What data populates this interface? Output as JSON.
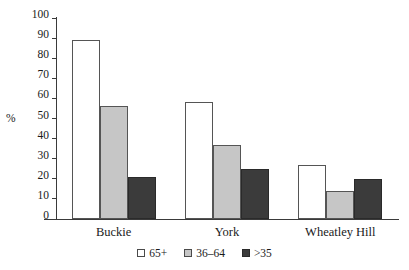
{
  "chart_data": {
    "type": "bar",
    "title": "",
    "subtitle": "",
    "xlabel": "",
    "ylabel": "%",
    "ylim": [
      0,
      100
    ],
    "ytick_step": 10,
    "yticks": [
      100,
      90,
      80,
      70,
      60,
      50,
      40,
      30,
      20,
      10,
      0
    ],
    "ytick_labels": [
      "100",
      "90",
      "80",
      "70",
      "60",
      "50",
      "40",
      "30",
      "20",
      "10",
      "0"
    ],
    "grid": false,
    "legend_position": "bottom-center",
    "categories": [
      "Buckie",
      "York",
      "Wheatley Hill"
    ],
    "series": [
      {
        "name": "65+",
        "color": "#ffffff",
        "values": [
          89,
          58,
          27
        ]
      },
      {
        "name": "36–64",
        "color": "#c6c6c6",
        "values": [
          56,
          37,
          14
        ]
      },
      {
        "name": ">35",
        "color": "#3b3b3b",
        "values": [
          21,
          25,
          20
        ]
      }
    ],
    "annotations": []
  },
  "axis": {
    "y_title": "%"
  },
  "legend": {
    "items": [
      {
        "label": "65+"
      },
      {
        "label": "36–64"
      },
      {
        "label": ">35"
      }
    ]
  },
  "colors": {
    "series_65_plus": "#ffffff",
    "series_36_64": "#c6c6c6",
    "series_over_35": "#3b3b3b",
    "axis": "#3a3a3a",
    "background": "#ffffff"
  }
}
